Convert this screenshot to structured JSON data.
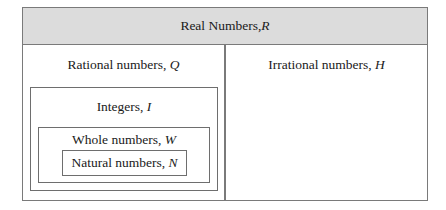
{
  "diagram": {
    "type": "nested-set-diagram",
    "title": {
      "text": "Real Numbers, ",
      "symbol": "R"
    },
    "left_panel": {
      "label": {
        "text": "Rational numbers, ",
        "symbol": "Q"
      },
      "nested": [
        {
          "text": "Integers, ",
          "symbol": "I"
        },
        {
          "text": "Whole numbers, ",
          "symbol": "W"
        },
        {
          "text": "Natural numbers, ",
          "symbol": "N"
        }
      ]
    },
    "right_panel": {
      "label": {
        "text": "Irrational numbers, ",
        "symbol": "H"
      }
    },
    "colors": {
      "header_fill": "#dcdcdc",
      "border": "#7a7a7a",
      "background": "#ffffff"
    }
  }
}
